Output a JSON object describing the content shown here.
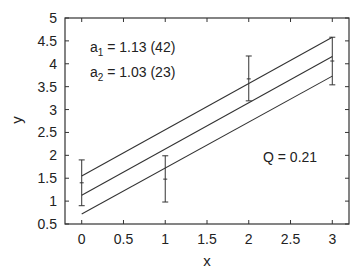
{
  "chart_data": {
    "type": "line",
    "title": "",
    "xlabel": "x",
    "ylabel": "y",
    "xlim": [
      -0.2,
      3.2
    ],
    "ylim": [
      0.5,
      5
    ],
    "grid": false,
    "x_ticks": [
      "0",
      "0.5",
      "1",
      "1.5",
      "2",
      "2.5",
      "3"
    ],
    "y_ticks": [
      "0.5",
      "1",
      "1.5",
      "2",
      "2.5",
      "3",
      "3.5",
      "4",
      "4.5",
      "5"
    ],
    "data_points": {
      "name": "measurements with error bars",
      "x": [
        0,
        1,
        2,
        3
      ],
      "y": [
        1.4,
        1.48,
        3.67,
        4.06
      ],
      "err_low": [
        0.9,
        0.98,
        3.19,
        3.54
      ],
      "err_high": [
        1.9,
        1.99,
        4.17,
        4.58
      ]
    },
    "series": [
      {
        "name": "fit upper band",
        "x": [
          0,
          3
        ],
        "y": [
          1.55,
          4.58
        ]
      },
      {
        "name": "fit",
        "x": [
          0,
          3
        ],
        "y": [
          1.13,
          4.16
        ]
      },
      {
        "name": "fit lower band",
        "x": [
          0,
          3
        ],
        "y": [
          0.72,
          3.73
        ]
      }
    ],
    "annotations": [
      {
        "text_main": "a",
        "sub": "1",
        "rest": " = 1.13 (42)"
      },
      {
        "text_main": "a",
        "sub": "2",
        "rest": " = 1.03 (23)"
      },
      {
        "text": "Q = 0.21"
      }
    ]
  }
}
